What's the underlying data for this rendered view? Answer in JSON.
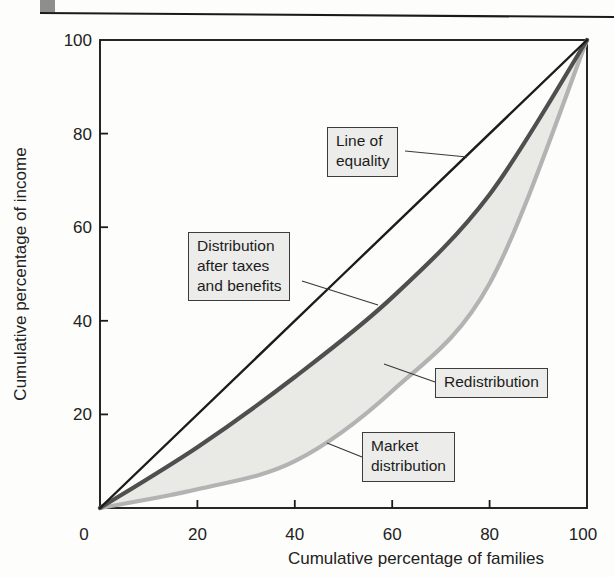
{
  "figure": {
    "type": "lorenz-curve-diagram",
    "accent_colors": {
      "equality_line": "#1c1c1c",
      "after_tax_curve": "#4f4f4f",
      "market_curve": "#b3b3b3",
      "shade_fill": "#e9e9e6",
      "label_box_fill": "#ececea",
      "page_rule": "#1a1a1a",
      "corner_square": "#8e8e8e"
    }
  },
  "labels": {
    "line_of_equality": "Line of\nequality",
    "after_tax": "Distribution\nafter taxes\nand benefits",
    "redistribution": "Redistribution",
    "market": "Market\ndistribution"
  },
  "chart_data": {
    "type": "line",
    "title": "",
    "xlabel": "Cumulative percentage of families",
    "ylabel": "Cumulative percentage of income",
    "xlim": [
      0,
      100
    ],
    "ylim": [
      0,
      100
    ],
    "grid": false,
    "legend_position": "annotated-boxes",
    "x_ticks": [
      0,
      20,
      40,
      60,
      80,
      100
    ],
    "y_ticks": [
      0,
      20,
      40,
      60,
      80,
      100
    ],
    "series": [
      {
        "name": "Line of equality",
        "color": "#1c1c1c",
        "width": 2.4,
        "points": [
          [
            0,
            0
          ],
          [
            100,
            100
          ]
        ]
      },
      {
        "name": "Distribution after taxes and benefits",
        "color": "#4f4f4f",
        "width": 4.2,
        "points": [
          [
            0,
            0
          ],
          [
            20,
            13
          ],
          [
            40,
            28
          ],
          [
            60,
            45
          ],
          [
            80,
            67
          ],
          [
            100,
            100
          ]
        ]
      },
      {
        "name": "Market distribution",
        "color": "#b3b3b3",
        "width": 4.2,
        "points": [
          [
            0,
            0
          ],
          [
            20,
            4
          ],
          [
            40,
            10
          ],
          [
            60,
            25
          ],
          [
            80,
            48
          ],
          [
            100,
            100
          ]
        ]
      }
    ],
    "shaded_region": {
      "name": "Redistribution",
      "between": [
        "Distribution after taxes and benefits",
        "Market distribution"
      ],
      "color": "#e9e9e6"
    }
  }
}
